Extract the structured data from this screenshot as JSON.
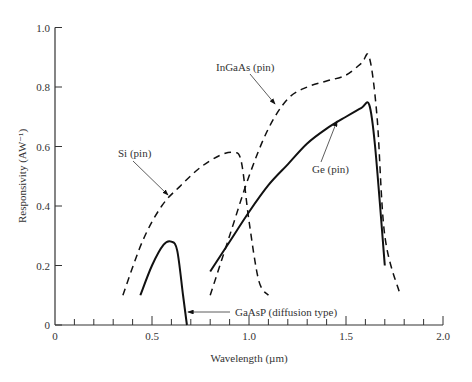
{
  "chart_data": {
    "type": "line",
    "title": "",
    "xlabel": "Wavelength (µm)",
    "ylabel": "Responsivity (AW⁻¹)",
    "xlim": [
      0,
      2.0
    ],
    "ylim": [
      0,
      1.0
    ],
    "x_ticks": [
      "0",
      "0.5",
      "1.0",
      "1.5",
      "2.0"
    ],
    "y_ticks": [
      "0",
      "0.2",
      "0.4",
      "0.6",
      "0.8",
      "1.0"
    ],
    "grid": false,
    "legend": "none (inline labels with arrows)",
    "series": [
      {
        "name": "Si (pin)",
        "style": "dashed",
        "x": [
          0.35,
          0.45,
          0.55,
          0.65,
          0.75,
          0.85,
          0.92,
          0.96,
          1.0,
          1.05,
          1.1
        ],
        "y": [
          0.1,
          0.28,
          0.4,
          0.47,
          0.53,
          0.57,
          0.58,
          0.55,
          0.35,
          0.15,
          0.1
        ]
      },
      {
        "name": "GaAsP (diffusion type)",
        "style": "solid",
        "x": [
          0.44,
          0.5,
          0.56,
          0.6,
          0.63,
          0.66,
          0.68
        ],
        "y": [
          0.1,
          0.2,
          0.27,
          0.28,
          0.25,
          0.1,
          0.0
        ]
      },
      {
        "name": "InGaAs (pin)",
        "style": "dashed",
        "x": [
          0.8,
          0.9,
          1.0,
          1.1,
          1.2,
          1.3,
          1.4,
          1.5,
          1.58,
          1.62,
          1.66,
          1.7,
          1.78
        ],
        "y": [
          0.1,
          0.3,
          0.5,
          0.66,
          0.76,
          0.8,
          0.82,
          0.84,
          0.88,
          0.9,
          0.7,
          0.3,
          0.1
        ]
      },
      {
        "name": "Ge (pin)",
        "style": "solid",
        "x": [
          0.8,
          0.9,
          1.0,
          1.1,
          1.2,
          1.3,
          1.4,
          1.5,
          1.58,
          1.62,
          1.65,
          1.7
        ],
        "y": [
          0.18,
          0.28,
          0.38,
          0.47,
          0.54,
          0.61,
          0.66,
          0.7,
          0.73,
          0.74,
          0.6,
          0.2
        ]
      }
    ],
    "annotations": [
      "Si (pin)",
      "InGaAs (pin)",
      "Ge (pin)",
      "GaAsP (diffusion type)"
    ]
  }
}
